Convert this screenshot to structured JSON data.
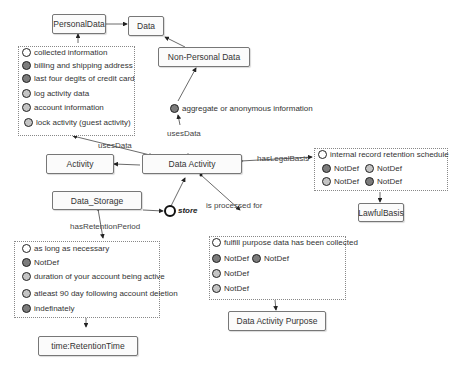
{
  "nodes": {
    "personal_data": "PersonalData",
    "data": "Data",
    "non_personal_data": "Non-Personal Data",
    "activity": "Activity",
    "data_activity": "Data Activity",
    "data_storage": "Data_Storage",
    "lawful_basis": "LawfulBasis",
    "retention_time": "time:RetentionTime",
    "data_activity_purpose": "Data Activity Purpose"
  },
  "edge_labels": {
    "uses_data_left": "usesData",
    "uses_data_top": "usesData",
    "has_legal_basis": "hasLegalBasis",
    "is_processed_for": "is processed for",
    "has_retention_period": "hasRetentionPeriod",
    "store": "store"
  },
  "personal_data_group": [
    {
      "label": "collected information",
      "fill": "white"
    },
    {
      "label": "billing and shipping address",
      "fill": "dark"
    },
    {
      "label": "last four degits of credit card",
      "fill": "dark"
    },
    {
      "label": "log activity data",
      "fill": "light"
    },
    {
      "label": "account information",
      "fill": "light"
    },
    {
      "label": "lock activity (guest activity)",
      "fill": "light"
    }
  ],
  "non_personal_instance": {
    "label": "aggregate or anonymous information",
    "fill": "dark"
  },
  "legal_basis_group": {
    "header": {
      "label": "internal record retention schedule",
      "fill": "white"
    },
    "items": [
      {
        "label": "NotDef",
        "fill": "dark"
      },
      {
        "label": "NotDef",
        "fill": "light"
      },
      {
        "label": "NotDef",
        "fill": "light"
      },
      {
        "label": "NotDef",
        "fill": "dark"
      }
    ]
  },
  "retention_group": [
    {
      "label": "as long as necessary",
      "fill": "white"
    },
    {
      "label": "NotDef",
      "fill": "dark"
    },
    {
      "label": "duration of your account being active",
      "fill": "light"
    },
    {
      "label": "atleast 90 day following account deletion",
      "fill": "light"
    },
    {
      "label": "indefinately",
      "fill": "dark"
    }
  ],
  "purpose_group": {
    "header": {
      "label": "fulfill purpose data has been collected",
      "fill": "white"
    },
    "items": [
      {
        "label": "NotDef",
        "fill": "dark"
      },
      {
        "label": "NotDef",
        "fill": "dark"
      },
      {
        "label": "NotDef",
        "fill": "light"
      },
      {
        "label": "NotDef",
        "fill": "light"
      }
    ]
  }
}
